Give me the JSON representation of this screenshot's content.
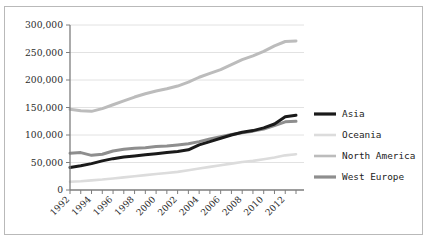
{
  "figure": {
    "border_color": "#b9b9b9",
    "background": "#ffffff"
  },
  "chart_data": {
    "type": "line",
    "title": "",
    "xlabel": "",
    "ylabel": "",
    "ylim": [
      0,
      300000
    ],
    "xlim": [
      1992,
      2013
    ],
    "grid": true,
    "legend_position": "right",
    "ytick_labels": [
      "0",
      "50,000",
      "100,000",
      "150,000",
      "200,000",
      "250,000",
      "300,000"
    ],
    "ytick_values": [
      0,
      50000,
      100000,
      150000,
      200000,
      250000,
      300000
    ],
    "xtick_labels": [
      "1992",
      "1994",
      "1996",
      "1998",
      "2000",
      "2002",
      "2004",
      "2006",
      "2008",
      "2010",
      "2012"
    ],
    "xtick_values": [
      1992,
      1994,
      1996,
      1998,
      2000,
      2002,
      2004,
      2006,
      2008,
      2010,
      2012
    ],
    "x": [
      1992,
      1993,
      1994,
      1995,
      1996,
      1997,
      1998,
      1999,
      2000,
      2001,
      2002,
      2003,
      2004,
      2005,
      2006,
      2007,
      2008,
      2009,
      2010,
      2011,
      2012,
      2013
    ],
    "series": [
      {
        "name": "Asia",
        "color": "#1a1a1a",
        "width": 3.0,
        "values": [
          41000,
          44000,
          48000,
          53000,
          57000,
          60000,
          62000,
          64000,
          66000,
          68000,
          70000,
          73000,
          82000,
          88000,
          94000,
          100000,
          105000,
          108000,
          113000,
          120000,
          133000,
          136000
        ]
      },
      {
        "name": "Oceania",
        "color": "#dcdcdc",
        "width": 2.6,
        "values": [
          15000,
          16000,
          17500,
          19000,
          21000,
          23000,
          25000,
          27000,
          29000,
          31000,
          33000,
          36000,
          39000,
          42000,
          45000,
          48000,
          51000,
          53000,
          56000,
          59000,
          63000,
          65000
        ]
      },
      {
        "name": "North America",
        "color": "#bcbcbc",
        "width": 3.0,
        "values": [
          147000,
          144000,
          143000,
          148000,
          155000,
          162000,
          169000,
          175000,
          180000,
          184000,
          189000,
          196000,
          205000,
          212000,
          219000,
          228000,
          237000,
          244000,
          252000,
          262000,
          270000,
          271000
        ]
      },
      {
        "name": "West Europe",
        "color": "#8e8e8e",
        "width": 3.0,
        "values": [
          67000,
          68000,
          63000,
          65000,
          71000,
          74000,
          76000,
          77000,
          79000,
          80000,
          82000,
          84000,
          88000,
          93000,
          97000,
          101000,
          104000,
          107000,
          111000,
          117000,
          124000,
          125000
        ]
      }
    ]
  },
  "legend": {
    "items": [
      {
        "label": "Asia",
        "color": "#1a1a1a"
      },
      {
        "label": "Oceania",
        "color": "#dcdcdc"
      },
      {
        "label": "North America",
        "color": "#bcbcbc"
      },
      {
        "label": "West Europe",
        "color": "#8e8e8e"
      }
    ]
  }
}
